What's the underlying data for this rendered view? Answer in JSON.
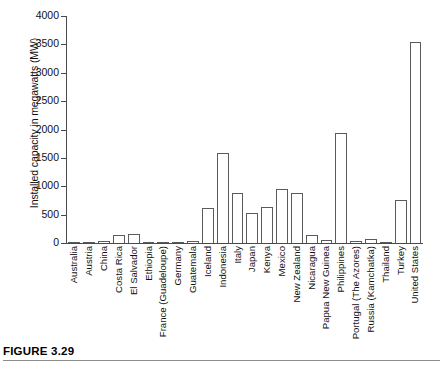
{
  "figure": {
    "caption_label": "FIGURE 3.29"
  },
  "chart_data": {
    "type": "bar",
    "title": "",
    "xlabel": "",
    "ylabel": "Installed capacity in megawatts (MW)",
    "ylim": [
      0,
      4000
    ],
    "ytick_step": 500,
    "yticks": [
      "4000",
      "3500",
      "3000",
      "2500",
      "2000",
      "1500",
      "1000",
      "500",
      "0"
    ],
    "grid": false,
    "legend": "none",
    "bar_fill_color": "#ffffff",
    "bar_edge_color": "#5b5b5b",
    "axis_color": "#4a4a4a",
    "categories": [
      "Australia",
      "Austria",
      "China",
      "Costa Rica",
      "El Salvador",
      "Ethiopia",
      "France (Guadeloupe)",
      "Germany",
      "Guatemala",
      "Iceland",
      "Indonesia",
      "Italy",
      "Japan",
      "Kenya",
      "Mexico",
      "New Zealand",
      "Nicaragua",
      "Papua New Guinea",
      "Philippines",
      "Portugal (The Azores)",
      "Russia (Kamchatka)",
      "Thailand",
      "Turkey",
      "United States"
    ],
    "values": [
      3,
      1,
      30,
      145,
      160,
      7,
      15,
      8,
      33,
      620,
      1580,
      890,
      535,
      630,
      955,
      890,
      140,
      56,
      1930,
      28,
      79,
      0,
      750,
      3550
    ]
  }
}
